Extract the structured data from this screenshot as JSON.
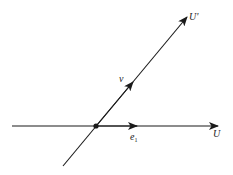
{
  "diagram": {
    "colors": {
      "line": "#1a1a1a",
      "label": "#222222",
      "background": "#ffffff"
    },
    "origin": {
      "x": 96,
      "y": 126
    },
    "axes": [
      {
        "id": "U",
        "label": "U",
        "from": [
          12,
          126
        ],
        "to": [
          216,
          126
        ]
      },
      {
        "id": "U_prime",
        "label": "U'",
        "from": [
          63,
          166
        ],
        "to": [
          187,
          17
        ]
      }
    ],
    "vectors": [
      {
        "id": "e1",
        "label": "e",
        "subscript": "1",
        "tip": [
          137,
          126
        ]
      },
      {
        "id": "v",
        "label": "v",
        "tip": [
          132,
          84
        ]
      }
    ]
  }
}
